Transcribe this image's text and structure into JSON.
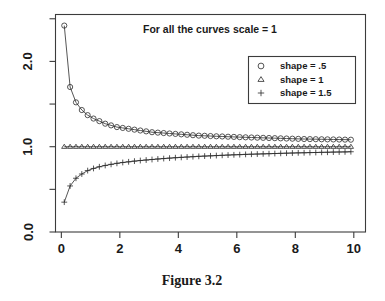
{
  "figure": {
    "caption": "Figure 3.2",
    "title": "For all the curves scale = 1"
  },
  "chart_data": {
    "type": "line",
    "title": "For all the curves scale = 1",
    "xlabel": "",
    "ylabel": "",
    "xlim": [
      -0.2,
      10.4
    ],
    "ylim": [
      0.0,
      2.55
    ],
    "grid": false,
    "legend_position": "top-right",
    "xticks": [
      0,
      2,
      4,
      6,
      8,
      10
    ],
    "xtick_labels": [
      "0",
      "2",
      "4",
      "6",
      "8",
      "10"
    ],
    "yticks": [
      0.0,
      0.5,
      1.0,
      1.5,
      2.0,
      2.5
    ],
    "ytick_labels": [
      "0.0",
      "",
      "1.0",
      "",
      "2.0",
      ""
    ],
    "x": [
      0.1,
      0.3,
      0.5,
      0.7,
      0.9,
      1.1,
      1.3,
      1.5,
      1.7,
      1.9,
      2.1,
      2.3,
      2.5,
      2.7,
      2.9,
      3.1,
      3.3,
      3.5,
      3.7,
      3.9,
      4.1,
      4.3,
      4.5,
      4.7,
      4.9,
      5.1,
      5.3,
      5.5,
      5.7,
      5.9,
      6.1,
      6.3,
      6.5,
      6.7,
      6.9,
      7.1,
      7.3,
      7.5,
      7.7,
      7.9,
      8.1,
      8.3,
      8.5,
      8.7,
      8.9,
      9.1,
      9.3,
      9.5,
      9.7,
      9.9
    ],
    "series": [
      {
        "name": "shape = .5",
        "marker": "circle",
        "values": [
          2.42,
          1.7,
          1.52,
          1.43,
          1.37,
          1.33,
          1.3,
          1.27,
          1.25,
          1.23,
          1.22,
          1.21,
          1.2,
          1.19,
          1.18,
          1.17,
          1.165,
          1.16,
          1.155,
          1.15,
          1.145,
          1.14,
          1.135,
          1.13,
          1.128,
          1.125,
          1.122,
          1.12,
          1.117,
          1.115,
          1.112,
          1.11,
          1.108,
          1.106,
          1.104,
          1.102,
          1.1,
          1.098,
          1.096,
          1.094,
          1.092,
          1.09,
          1.089,
          1.088,
          1.087,
          1.086,
          1.085,
          1.084,
          1.083,
          1.082
        ]
      },
      {
        "name": "shape = 1",
        "marker": "triangle",
        "values": [
          1.0,
          1.0,
          1.0,
          1.0,
          1.0,
          1.0,
          1.0,
          1.0,
          1.0,
          1.0,
          1.0,
          1.0,
          1.0,
          1.0,
          1.0,
          1.0,
          1.0,
          1.0,
          1.0,
          1.0,
          1.0,
          1.0,
          1.0,
          1.0,
          1.0,
          1.0,
          1.0,
          1.0,
          1.0,
          1.0,
          1.0,
          1.0,
          1.0,
          1.0,
          1.0,
          1.0,
          1.0,
          1.0,
          1.0,
          1.0,
          1.0,
          1.0,
          1.0,
          1.0,
          1.0,
          1.0,
          1.0,
          1.0,
          1.0,
          1.0
        ]
      },
      {
        "name": "shape = 1.5",
        "marker": "plus",
        "values": [
          0.35,
          0.54,
          0.63,
          0.68,
          0.72,
          0.745,
          0.765,
          0.78,
          0.793,
          0.805,
          0.815,
          0.823,
          0.831,
          0.838,
          0.844,
          0.85,
          0.856,
          0.861,
          0.866,
          0.871,
          0.875,
          0.879,
          0.883,
          0.887,
          0.89,
          0.893,
          0.896,
          0.899,
          0.902,
          0.905,
          0.907,
          0.91,
          0.912,
          0.914,
          0.916,
          0.918,
          0.92,
          0.922,
          0.924,
          0.926,
          0.928,
          0.929,
          0.931,
          0.932,
          0.934,
          0.935,
          0.937,
          0.938,
          0.939,
          0.941
        ]
      }
    ],
    "legend": [
      {
        "label": "shape = .5",
        "marker": "circle"
      },
      {
        "label": "shape = 1",
        "marker": "triangle"
      },
      {
        "label": "shape = 1.5",
        "marker": "plus"
      }
    ]
  }
}
